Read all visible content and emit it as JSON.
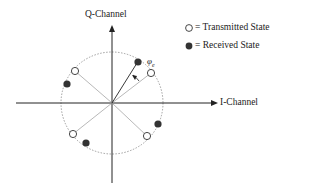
{
  "diagram": {
    "type": "constellation",
    "axes": {
      "q_label": "Q-Channel",
      "i_label": "I-Channel"
    },
    "phase_label": "φ",
    "phase_subscript": "e",
    "legend": {
      "transmitted_label": "= Transmitted State",
      "received_label": "= Received State"
    },
    "colors": {
      "axis": "#222222",
      "circle": "#888888",
      "spoke": "#999999",
      "received_fill": "#333333",
      "transmitted_fill": "#ffffff"
    }
  }
}
